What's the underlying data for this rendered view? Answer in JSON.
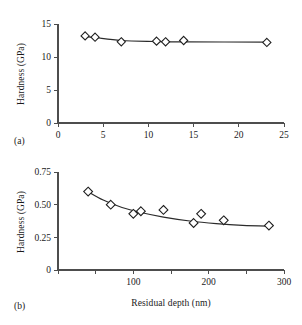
{
  "figure": {
    "panel_a_label": "(a)",
    "panel_b_label": "(b)"
  },
  "chart_data": [
    {
      "type": "scatter",
      "panel": "(a)",
      "title": "",
      "xlabel": "",
      "ylabel": "Hardness (GPa)",
      "xlim": [
        0,
        25
      ],
      "ylim": [
        0,
        15
      ],
      "xticks": [
        0,
        5,
        10,
        15,
        20,
        25
      ],
      "xticklabels": [
        "0",
        "5",
        "10",
        "15",
        "20",
        "25"
      ],
      "yticks": [
        0,
        5,
        10,
        15
      ],
      "yticklabels": [
        "0",
        "5",
        "10",
        "15"
      ],
      "grid": false,
      "legend": false,
      "marker": "open-diamond",
      "series": [
        {
          "name": "Hardness vs depth (a)",
          "x": [
            3.0,
            4.1,
            7.0,
            10.9,
            11.9,
            13.9,
            23.1
          ],
          "y": [
            13.2,
            13.0,
            12.3,
            12.4,
            12.3,
            12.5,
            12.2
          ]
        }
      ],
      "fit_line": {
        "name": "trend",
        "x": [
          3.0,
          4.1,
          7.0,
          10.9,
          11.9,
          13.9,
          23.1
        ],
        "y": [
          13.1,
          12.95,
          12.5,
          12.35,
          12.3,
          12.3,
          12.25
        ]
      }
    },
    {
      "type": "scatter",
      "panel": "(b)",
      "title": "",
      "xlabel": "Residual depth (nm)",
      "ylabel": "Hardness (GPa)",
      "xlim": [
        0,
        300
      ],
      "ylim": [
        0,
        0.75
      ],
      "xticks": [
        0,
        50,
        100,
        150,
        200,
        250,
        300
      ],
      "xticklabels": [
        "",
        "",
        "100",
        "",
        "200",
        "",
        "300"
      ],
      "yticks": [
        0,
        0.25,
        0.5,
        0.75
      ],
      "yticklabels": [
        "0",
        "0.25",
        "0.50",
        "0.75"
      ],
      "grid": false,
      "legend": false,
      "marker": "open-diamond",
      "series": [
        {
          "name": "Hardness vs residual depth (b)",
          "x": [
            40,
            70,
            100,
            110,
            140,
            180,
            190,
            220,
            280
          ],
          "y": [
            0.6,
            0.5,
            0.43,
            0.45,
            0.46,
            0.36,
            0.43,
            0.38,
            0.34
          ]
        }
      ],
      "fit_line": {
        "name": "trend",
        "x": [
          38,
          60,
          85,
          110,
          140,
          175,
          210,
          245,
          285
        ],
        "y": [
          0.605,
          0.535,
          0.478,
          0.44,
          0.405,
          0.375,
          0.355,
          0.342,
          0.335
        ]
      }
    }
  ]
}
